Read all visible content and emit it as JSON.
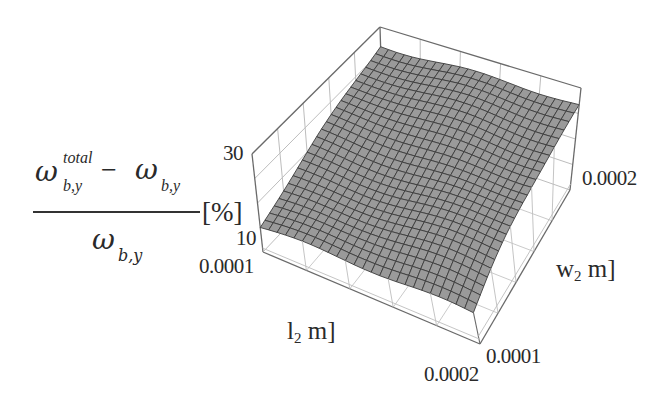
{
  "chart_data": {
    "type": "surface3d",
    "title": "",
    "xlabel": "l2 m]",
    "ylabel": "w2 m]",
    "zlabel": "(ω_b,y^total − ω_b,y) / ω_b,y [%]",
    "x_axis": {
      "name": "l2",
      "unit": "m",
      "range": [
        0.0001,
        0.0002
      ],
      "ticks": [
        "0.0001",
        "0.0002"
      ]
    },
    "y_axis": {
      "name": "w2",
      "unit": "m",
      "range": [
        0.0001,
        0.0002
      ],
      "ticks": [
        "0.0001",
        "0.0002"
      ]
    },
    "z_axis": {
      "range": [
        0,
        40
      ],
      "ticks": [
        "10",
        "30"
      ]
    },
    "surface": {
      "description": "Near-planar surface rising with w2, roughly flat along l2",
      "grid_resolution": [
        25,
        25
      ],
      "corners": [
        {
          "l2": 0.0001,
          "w2": 0.0001,
          "z": 10
        },
        {
          "l2": 0.0002,
          "w2": 0.0001,
          "z": 10
        },
        {
          "l2": 0.0001,
          "w2": 0.0002,
          "z": 33
        },
        {
          "l2": 0.0002,
          "w2": 0.0002,
          "z": 33
        }
      ]
    },
    "grid": true,
    "legend": null
  },
  "labels": {
    "z_tick_30": "30",
    "z_tick_10": "10",
    "l2_tick_low": "0.0001",
    "l2_tick_high": "0.0002",
    "w2_tick_low": "0.0001",
    "w2_tick_high": "0.0002",
    "l2_title_main": "l",
    "l2_title_sub": "2",
    "l2_title_unit": " m]",
    "w2_title_main": "w",
    "w2_title_sub": "2",
    "w2_title_unit": " m]",
    "z_title": {
      "omega": "ω",
      "sup_total": "total",
      "sub_by": "b,y",
      "minus": " −",
      "percent": "[%]"
    }
  },
  "colors": {
    "surface_fill": "#9a9a9a",
    "mesh_line": "#3c3c3c",
    "box_line": "#6a6a6a",
    "grid_line": "#bdbdbd",
    "text": "#2a2a2a"
  }
}
